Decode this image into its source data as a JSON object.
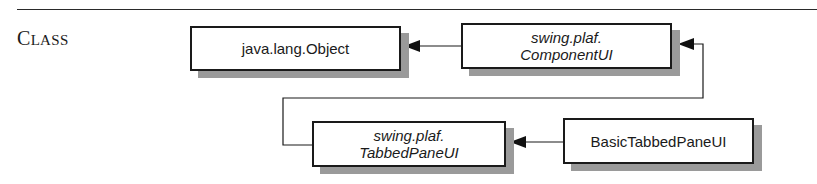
{
  "section": {
    "heading_initial": "C",
    "heading_rest": "LASS"
  },
  "diagram": {
    "nodes": [
      {
        "id": "object",
        "label": "java.lang.Object",
        "abstract": false
      },
      {
        "id": "component_ui",
        "label": "swing.plaf.\nComponentUI",
        "abstract": true
      },
      {
        "id": "tabbed_pane_ui",
        "label": "swing.plaf.\nTabbedPaneUI",
        "abstract": true
      },
      {
        "id": "basic_tabbed_pane_ui",
        "label": "BasicTabbedPaneUI",
        "abstract": false
      }
    ],
    "edges": [
      {
        "from": "component_ui",
        "to": "object",
        "type": "inheritance"
      },
      {
        "from": "tabbed_pane_ui",
        "to": "component_ui",
        "type": "inheritance"
      },
      {
        "from": "basic_tabbed_pane_ui",
        "to": "tabbed_pane_ui",
        "type": "inheritance"
      }
    ],
    "colors": {
      "line": "#1a1a1a",
      "shadow": "#9a9a9a",
      "box_fill": "#ffffff"
    }
  }
}
